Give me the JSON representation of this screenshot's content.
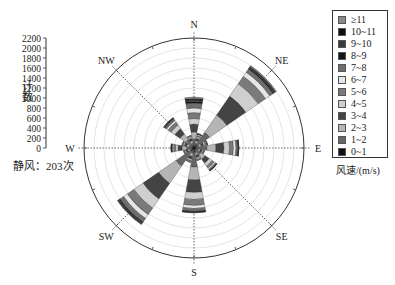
{
  "chart_data": {
    "type": "wind-rose",
    "title": "",
    "ylabel": "计数",
    "radial_axis": {
      "min": 0,
      "max": 2200,
      "step": 200,
      "ticks": [
        "0",
        "200",
        "400",
        "600",
        "800",
        "1000",
        "1200",
        "1400",
        "1600",
        "1800",
        "2000",
        "2200"
      ]
    },
    "directions": [
      "N",
      "NNE",
      "NE",
      "ENE",
      "E",
      "ESE",
      "SE",
      "SSE",
      "S",
      "SSW",
      "SW",
      "WSW",
      "W",
      "WNW",
      "NW",
      "NNW"
    ],
    "direction_labels": [
      "N",
      "NE",
      "E",
      "SE",
      "S",
      "SW",
      "W",
      "NW"
    ],
    "legend_title": "风速/(m/s)",
    "speed_bins": [
      "0~1",
      "1~2",
      "2~3",
      "3~4",
      "4~5",
      "5~6",
      "6~7",
      "7~8",
      "8~9",
      "9~10",
      "10~11",
      "≥11"
    ],
    "bin_colors": [
      "#111111",
      "#666666",
      "#b5b5b5",
      "#444444",
      "#cfcfcf",
      "#7a7a7a",
      "#e6e6e6",
      "#6e6e6e",
      "#151515",
      "#3a3a3a",
      "#0d0d0d",
      "#8a8a8a"
    ],
    "totals_by_direction": [
      1020,
      300,
      2000,
      280,
      900,
      220,
      560,
      260,
      1300,
      300,
      1860,
      220,
      460,
      250,
      740,
      260
    ],
    "series": [
      {
        "direction": "N",
        "values": [
          60,
          120,
          140,
          160,
          110,
          120,
          90,
          100,
          30,
          40,
          20,
          30
        ]
      },
      {
        "direction": "NNE",
        "values": [
          40,
          60,
          50,
          50,
          30,
          30,
          20,
          10,
          5,
          5,
          0,
          0
        ]
      },
      {
        "direction": "NE",
        "values": [
          80,
          300,
          420,
          460,
          300,
          180,
          100,
          80,
          20,
          30,
          10,
          20
        ]
      },
      {
        "direction": "ENE",
        "values": [
          40,
          60,
          50,
          50,
          30,
          25,
          15,
          5,
          3,
          2,
          0,
          0
        ]
      },
      {
        "direction": "E",
        "values": [
          60,
          200,
          180,
          160,
          110,
          80,
          50,
          40,
          10,
          5,
          2,
          3
        ]
      },
      {
        "direction": "ESE",
        "values": [
          40,
          50,
          40,
          40,
          20,
          15,
          10,
          5,
          0,
          0,
          0,
          0
        ]
      },
      {
        "direction": "SE",
        "values": [
          50,
          120,
          100,
          100,
          70,
          50,
          30,
          25,
          5,
          5,
          2,
          3
        ]
      },
      {
        "direction": "SSE",
        "values": [
          40,
          60,
          50,
          50,
          30,
          15,
          10,
          5,
          0,
          0,
          0,
          0
        ]
      },
      {
        "direction": "S",
        "values": [
          80,
          300,
          260,
          250,
          140,
          120,
          60,
          60,
          10,
          10,
          5,
          5
        ]
      },
      {
        "direction": "SSW",
        "values": [
          40,
          70,
          60,
          60,
          30,
          20,
          10,
          10,
          0,
          0,
          0,
          0
        ]
      },
      {
        "direction": "SW",
        "values": [
          80,
          360,
          420,
          380,
          220,
          160,
          90,
          90,
          20,
          20,
          10,
          10
        ]
      },
      {
        "direction": "WSW",
        "values": [
          40,
          50,
          40,
          40,
          20,
          15,
          10,
          5,
          0,
          0,
          0,
          0
        ]
      },
      {
        "direction": "W",
        "values": [
          50,
          100,
          90,
          80,
          50,
          40,
          20,
          20,
          5,
          3,
          1,
          1
        ]
      },
      {
        "direction": "WNW",
        "values": [
          40,
          60,
          50,
          50,
          25,
          15,
          5,
          5,
          0,
          0,
          0,
          0
        ]
      },
      {
        "direction": "NW",
        "values": [
          50,
          150,
          140,
          130,
          90,
          70,
          40,
          40,
          10,
          10,
          5,
          5
        ]
      },
      {
        "direction": "NNW",
        "values": [
          40,
          60,
          50,
          50,
          30,
          15,
          10,
          5,
          0,
          0,
          0,
          0
        ]
      }
    ],
    "annotation": "静风：203次",
    "grid": true,
    "legend_position": "right"
  },
  "labels": {
    "ylabel": "计数",
    "calm": "静风：203次",
    "legend_title": "风速/(m/s)"
  },
  "legend": [
    {
      "label": "≥11",
      "color": "#8a8a8a"
    },
    {
      "label": "10~11",
      "color": "#0d0d0d"
    },
    {
      "label": "9~10",
      "color": "#3a3a3a"
    },
    {
      "label": "8~9",
      "color": "#151515"
    },
    {
      "label": "7~8",
      "color": "#6e6e6e"
    },
    {
      "label": "6~7",
      "color": "#e6e6e6"
    },
    {
      "label": "5~6",
      "color": "#7a7a7a"
    },
    {
      "label": "4~5",
      "color": "#cfcfcf"
    },
    {
      "label": "3~4",
      "color": "#444444"
    },
    {
      "label": "2~3",
      "color": "#b5b5b5"
    },
    {
      "label": "1~2",
      "color": "#666666"
    },
    {
      "label": "0~1",
      "color": "#111111"
    }
  ]
}
